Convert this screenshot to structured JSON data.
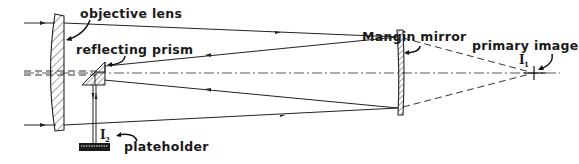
{
  "labels": {
    "objective_lens": "objective lens",
    "reflecting_prism": "reflecting prism",
    "mangin_mirror": "Mangin mirror",
    "primary_image": "primary image",
    "primary_image_symbol": "I",
    "primary_image_subscript": "1",
    "plateholder": "plateholder",
    "secondary_image_symbol": "I",
    "secondary_image_subscript": "2"
  },
  "components": [
    {
      "name": "objective lens",
      "type": "lens"
    },
    {
      "name": "reflecting prism",
      "type": "prism"
    },
    {
      "name": "Mangin mirror",
      "type": "mirror"
    },
    {
      "name": "primary image",
      "type": "focus-point"
    },
    {
      "name": "plateholder",
      "type": "detector"
    }
  ],
  "icons": {
    "ray_arrow": "arrowhead",
    "pointer": "curved-arrow"
  }
}
